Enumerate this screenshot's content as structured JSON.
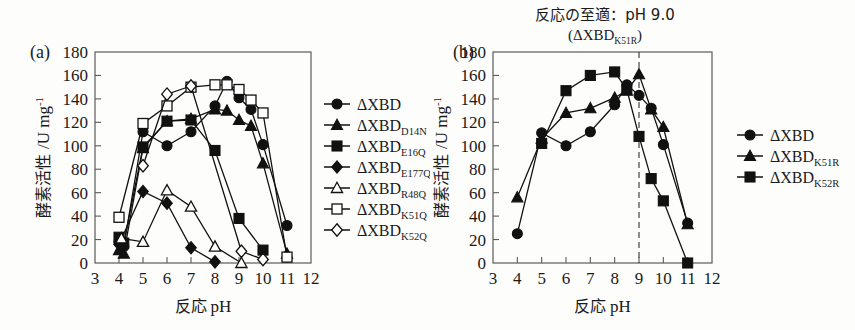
{
  "figure": {
    "panel_a_letter": "(a)",
    "panel_b_letter": "(b)",
    "axis": {
      "x_label_jp": "反応",
      "x_label_en": "pH",
      "y_label_jp": "酵素活性",
      "y_label_unit": "/U mg",
      "y_label_exp": "-1",
      "x_ticks": [
        3,
        4,
        5,
        6,
        7,
        8,
        9,
        10,
        11,
        12
      ],
      "y_ticks": [
        0,
        20,
        40,
        60,
        80,
        100,
        120,
        140,
        160,
        180
      ],
      "xlim": [
        3,
        12
      ],
      "ylim": [
        0,
        180
      ]
    },
    "panel_b_title_line1": "反応の至適：pH 9.0",
    "panel_b_title_line2_open": "(",
    "panel_b_title_line2_base": "ΔXBD",
    "panel_b_title_line2_sub": "K51R",
    "panel_b_title_line2_close": ")",
    "panel_b_optimum_ph": 9.0
  },
  "chart_data": [
    {
      "id": "panel-a",
      "type": "line",
      "title": "",
      "xlabel": "反応 pH",
      "ylabel": "酵素活性 /U mg-1",
      "xlim": [
        3,
        12
      ],
      "ylim": [
        0,
        180
      ],
      "grid": false,
      "legend_position": "right",
      "series": [
        {
          "name": "ΔXBD",
          "name_base": "ΔXBD",
          "name_sub": "",
          "marker": "circle-filled",
          "x": [
            4,
            4.2,
            5,
            6,
            7,
            8,
            8.5,
            9,
            9.5,
            10,
            11
          ],
          "y": [
            18,
            14,
            112,
            100,
            112,
            134,
            155,
            141,
            131,
            101,
            32
          ]
        },
        {
          "name": "ΔXBD D14N",
          "name_base": "ΔXBD",
          "name_sub": "D14N",
          "marker": "triangle-filled",
          "x": [
            4,
            4.2,
            5,
            6,
            7,
            8,
            8.5,
            9,
            9.5,
            10,
            11
          ],
          "y": [
            11,
            8,
            98,
            121,
            123,
            131,
            130,
            122,
            117,
            85,
            8
          ]
        },
        {
          "name": "ΔXBD E16Q",
          "name_base": "ΔXBD",
          "name_sub": "E16Q",
          "marker": "square-filled",
          "x": [
            4,
            4.2,
            5,
            6,
            7,
            8,
            9,
            10
          ],
          "y": [
            22,
            17,
            99,
            121,
            122,
            96,
            38,
            11
          ]
        },
        {
          "name": "ΔXBD E177Q",
          "name_base": "ΔXBD",
          "name_sub": "E177Q",
          "marker": "diamond-filled",
          "x": [
            4,
            5,
            6,
            7,
            8
          ],
          "y": [
            16,
            61,
            51,
            13,
            1
          ]
        },
        {
          "name": "ΔXBD R48Q",
          "name_base": "ΔXBD",
          "name_sub": "R48Q",
          "marker": "triangle-open",
          "x": [
            4.1,
            5,
            6,
            7,
            8,
            9.1
          ],
          "y": [
            21,
            18,
            62,
            48,
            14,
            0
          ]
        },
        {
          "name": "ΔXBD K51Q",
          "name_base": "ΔXBD",
          "name_sub": "K51Q",
          "marker": "square-open",
          "x": [
            4,
            5,
            6,
            7,
            8,
            8.5,
            9,
            9.5,
            10,
            11
          ],
          "y": [
            39,
            119,
            134,
            150,
            152,
            152,
            148,
            139,
            128,
            5
          ]
        },
        {
          "name": "ΔXBD K52Q",
          "name_base": "ΔXBD",
          "name_sub": "K52Q",
          "marker": "diamond-open",
          "x": [
            5,
            6,
            7,
            9.1,
            10
          ],
          "y": [
            83,
            144,
            151,
            10,
            3
          ]
        }
      ]
    },
    {
      "id": "panel-b",
      "type": "line",
      "title": "反応の至適：pH 9.0 (ΔXBD K51R)",
      "xlabel": "反応 pH",
      "ylabel": "酵素活性 /U mg-1",
      "xlim": [
        3,
        12
      ],
      "ylim": [
        0,
        180
      ],
      "grid": false,
      "legend_position": "right",
      "annotations": [
        {
          "type": "vline",
          "x": 9.0,
          "style": "dashed"
        }
      ],
      "series": [
        {
          "name": "ΔXBD",
          "name_base": "ΔXBD",
          "name_sub": "",
          "marker": "circle-filled",
          "x": [
            4,
            5,
            6,
            7,
            8,
            8.5,
            9,
            9.5,
            10,
            11
          ],
          "y": [
            25,
            111,
            100,
            112,
            135,
            152,
            143,
            132,
            101,
            34
          ]
        },
        {
          "name": "ΔXBD K51R",
          "name_base": "ΔXBD",
          "name_sub": "K51R",
          "marker": "triangle-filled",
          "x": [
            4,
            5,
            6,
            7,
            8,
            8.5,
            9,
            9.5,
            10,
            11
          ],
          "y": [
            56,
            106,
            128,
            132,
            141,
            147,
            161,
            131,
            116,
            33
          ]
        },
        {
          "name": "ΔXBD K52R",
          "name_base": "ΔXBD",
          "name_sub": "K52R",
          "marker": "square-filled",
          "x": [
            5,
            6,
            7,
            8,
            8.5,
            9,
            9.5,
            10,
            11
          ],
          "y": [
            102,
            147,
            160,
            163,
            148,
            108,
            72,
            53,
            0
          ]
        }
      ]
    }
  ]
}
